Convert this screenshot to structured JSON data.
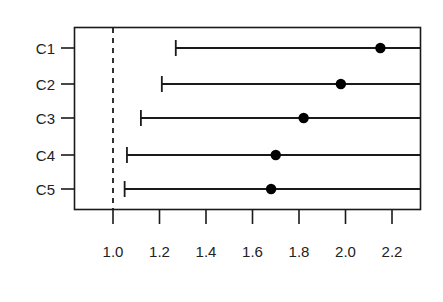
{
  "chart_data": {
    "type": "scatter",
    "title": "",
    "subtitle": "",
    "xlabel": "",
    "ylabel": "",
    "orientation": "horizontal",
    "plot_style": "forest-plot",
    "grid": false,
    "legend": null,
    "categories": [
      "C1",
      "C2",
      "C3",
      "C4",
      "C5"
    ],
    "x_ticks": [
      1.0,
      1.2,
      1.4,
      1.6,
      1.8,
      2.0,
      2.2
    ],
    "x_tick_labels": [
      "1.0",
      "1.2",
      "1.4",
      "1.6",
      "1.8",
      "2.0",
      "2.2"
    ],
    "xlim": [
      0.83,
      2.32
    ],
    "reference_line": {
      "value": 1.0,
      "style": "dashed",
      "color": "#1a1a1a"
    },
    "series": [
      {
        "name": "estimate",
        "marker": "filled-circle",
        "color": "#000000",
        "values": [
          2.15,
          1.98,
          1.82,
          1.7,
          1.68
        ]
      },
      {
        "name": "lower-bound",
        "values": [
          1.27,
          1.21,
          1.12,
          1.06,
          1.05
        ]
      },
      {
        "name": "upper-bound",
        "values": [
          null,
          null,
          null,
          null,
          null
        ],
        "note": "upper bounds extend past right edge of plotting range"
      }
    ],
    "points": [
      {
        "category": "C1",
        "estimate": 2.15,
        "lower": 1.27,
        "upper_clipped": true
      },
      {
        "category": "C2",
        "estimate": 1.98,
        "lower": 1.21,
        "upper_clipped": true
      },
      {
        "category": "C3",
        "estimate": 1.82,
        "lower": 1.12,
        "upper_clipped": true
      },
      {
        "category": "C4",
        "estimate": 1.7,
        "lower": 1.06,
        "upper_clipped": true
      },
      {
        "category": "C5",
        "estimate": 1.68,
        "lower": 1.05,
        "upper_clipped": true
      }
    ],
    "colors": {
      "axis": "#1a1a1a",
      "marker": "#000000",
      "interval_line": "#1a1a1a",
      "reference_line": "#1a1a1a",
      "background": "#ffffff"
    }
  }
}
